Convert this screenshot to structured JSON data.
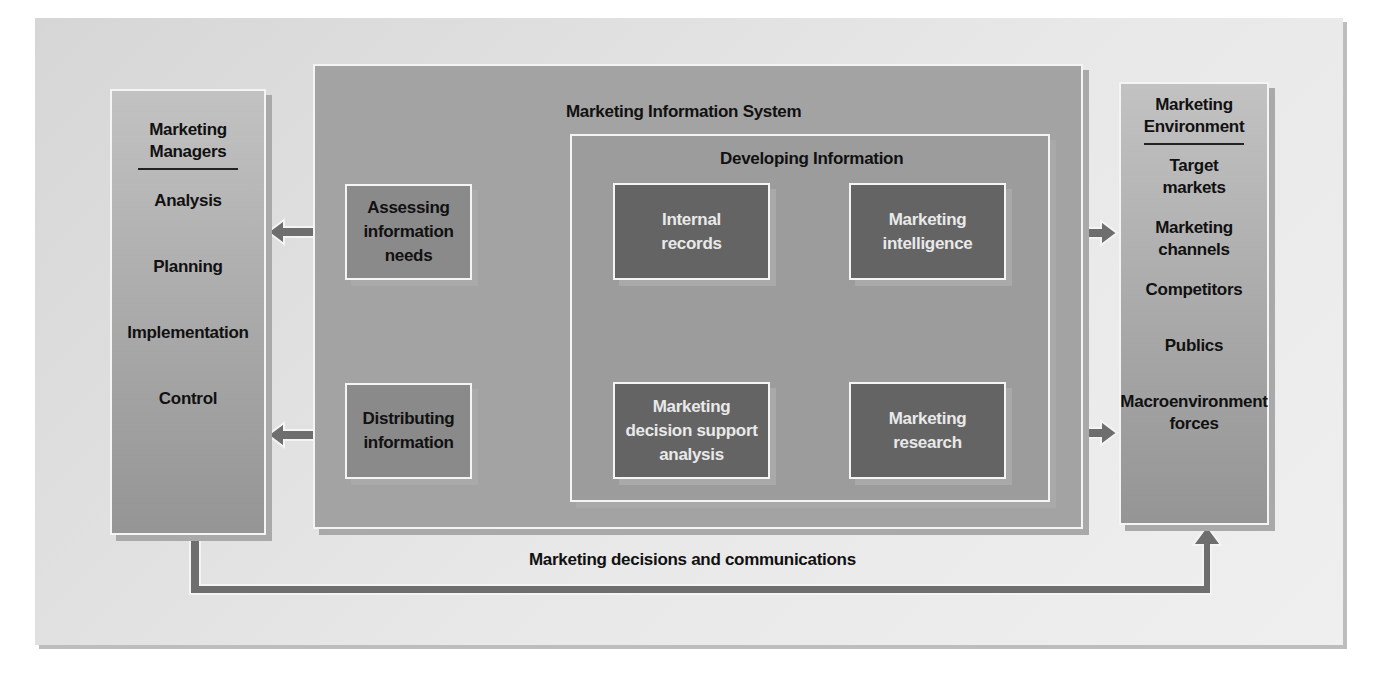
{
  "diagram": {
    "title": "Marketing Information System",
    "managers": {
      "title_line1": "Marketing",
      "title_line2": "Managers",
      "items": [
        "Analysis",
        "Planning",
        "Implementation",
        "Control"
      ]
    },
    "mis": {
      "label": "Marketing Information System",
      "assessing": {
        "line1": "Assessing",
        "line2": "information",
        "line3": "needs"
      },
      "distributing": {
        "line1": "Distributing",
        "line2": "information"
      }
    },
    "developing": {
      "label": "Developing Information",
      "internal_records": {
        "line1": "Internal",
        "line2": "records"
      },
      "marketing_intelligence": {
        "line1": "Marketing",
        "line2": "intelligence"
      },
      "decision_support": {
        "line1": "Marketing",
        "line2": "decision support",
        "line3": "analysis"
      },
      "marketing_research": {
        "line1": "Marketing",
        "line2": "research"
      }
    },
    "environment": {
      "title_line1": "Marketing",
      "title_line2": "Environment",
      "items": [
        {
          "line1": "Target",
          "line2": "markets"
        },
        {
          "line1": "Marketing",
          "line2": "channels"
        },
        {
          "line1": "Competitors",
          "line2": ""
        },
        {
          "line1": "Publics",
          "line2": ""
        },
        {
          "line1": "Macroenvironment",
          "line2": "forces"
        }
      ]
    },
    "bottom_flow_label": "Marketing decisions and communications",
    "colors": {
      "background": "#e3e3e3",
      "panel": "#a3a3a3",
      "dark_box": "#646464",
      "arrow": "#6e6e6e",
      "border": "#f4f4f4"
    }
  }
}
